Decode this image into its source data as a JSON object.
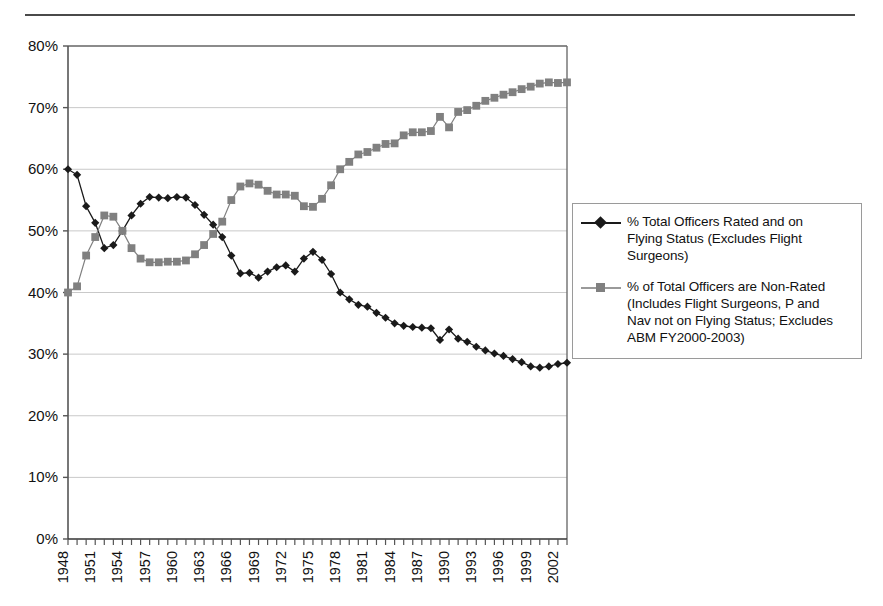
{
  "chart_data": {
    "type": "line",
    "title": "",
    "subtitle": "",
    "xlabel": "",
    "ylabel": "",
    "xlim": [
      1948,
      2003
    ],
    "ylim": [
      0,
      0.8
    ],
    "ytick_labels": [
      "0%",
      "10%",
      "20%",
      "30%",
      "40%",
      "50%",
      "60%",
      "70%",
      "80%"
    ],
    "ytick_values": [
      0,
      10,
      20,
      30,
      40,
      50,
      60,
      70,
      80
    ],
    "xtick_labels": [
      "1948",
      "1951",
      "1954",
      "1957",
      "1960",
      "1963",
      "1966",
      "1969",
      "1972",
      "1975",
      "1978",
      "1981",
      "1984",
      "1987",
      "1990",
      "1993",
      "1996",
      "1999",
      "2002"
    ],
    "xtick_step": 3,
    "grid": "horizontal",
    "legend_position": "right",
    "x": [
      1948,
      1949,
      1950,
      1951,
      1952,
      1953,
      1954,
      1955,
      1956,
      1957,
      1958,
      1959,
      1960,
      1961,
      1962,
      1963,
      1964,
      1965,
      1966,
      1967,
      1968,
      1969,
      1970,
      1971,
      1972,
      1973,
      1974,
      1975,
      1976,
      1977,
      1978,
      1979,
      1980,
      1981,
      1982,
      1983,
      1984,
      1985,
      1986,
      1987,
      1988,
      1989,
      1990,
      1991,
      1992,
      1993,
      1994,
      1995,
      1996,
      1997,
      1998,
      1999,
      2000,
      2001,
      2002,
      2003
    ],
    "series": [
      {
        "name": "% Total Officers Rated and on Flying Status (Excludes Flight Surgeons)",
        "color": "#1a1a1a",
        "marker": "diamond",
        "values": [
          60.0,
          59.1,
          54.0,
          51.3,
          47.2,
          47.7,
          50.0,
          52.5,
          54.4,
          55.5,
          55.4,
          55.3,
          55.5,
          55.4,
          54.2,
          52.6,
          51.0,
          49.0,
          46.0,
          43.1,
          43.2,
          42.4,
          43.4,
          44.1,
          44.4,
          43.4,
          45.5,
          46.6,
          45.3,
          43.0,
          40.0,
          38.9,
          38.0,
          37.7,
          36.7,
          35.9,
          35.0,
          34.6,
          34.4,
          34.3,
          34.2,
          32.3,
          34.0,
          32.5,
          32.0,
          31.2,
          30.6,
          30.1,
          29.7,
          29.2,
          28.7,
          28.0,
          27.8,
          28.0,
          28.4,
          28.6
        ]
      },
      {
        "name": "% of Total Officers are Non-Rated (Includes Flight Surgeons, P and Nav not on Flying Status; Excludes ABM FY2000-2003)",
        "color": "#808080",
        "marker": "square",
        "values": [
          40.0,
          41.0,
          46.0,
          49.0,
          52.5,
          52.3,
          50.0,
          47.2,
          45.5,
          44.9,
          44.9,
          45.0,
          45.0,
          45.2,
          46.2,
          47.7,
          49.5,
          51.5,
          55.0,
          57.2,
          57.7,
          57.5,
          56.5,
          55.9,
          55.9,
          55.7,
          54.0,
          53.9,
          55.2,
          57.4,
          60.0,
          61.2,
          62.4,
          62.8,
          63.5,
          64.1,
          64.2,
          65.5,
          66.0,
          66.0,
          66.2,
          68.5,
          66.8,
          69.3,
          69.6,
          70.3,
          71.1,
          71.6,
          72.1,
          72.5,
          73.0,
          73.4,
          73.9,
          74.1,
          74.0,
          74.1
        ]
      }
    ]
  },
  "legend": {
    "entries": [
      {
        "label": "% Total Officers Rated and on\nFlying Status (Excludes Flight\nSurgeons)",
        "marker": "diamond",
        "color": "#1a1a1a"
      },
      {
        "label": "% of Total Officers are Non-Rated\n(Includes Flight Surgeons, P and\nNav not on Flying Status; Excludes\nABM FY2000-2003)",
        "marker": "square",
        "color": "#808080"
      }
    ]
  }
}
